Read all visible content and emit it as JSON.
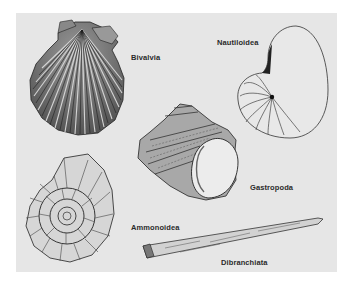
{
  "figure": {
    "background_color": "#e6e6e6",
    "labels": {
      "bivalvia": "Bivalvia",
      "nautiloidea": "Nautiloidea",
      "gastropoda": "Gastropoda",
      "ammonoidea": "Ammonoidea",
      "dibranchiata": "Dibranchiata"
    },
    "illustrations": [
      {
        "name": "scallop-shell",
        "label": "Bivalvia"
      },
      {
        "name": "nautilus-shell",
        "label": "Nautiloidea"
      },
      {
        "name": "turban-snail-shell",
        "label": "Gastropoda"
      },
      {
        "name": "ammonite-shell",
        "label": "Ammonoidea"
      },
      {
        "name": "belemnite-rostrum",
        "label": "Dibranchiata"
      }
    ]
  }
}
